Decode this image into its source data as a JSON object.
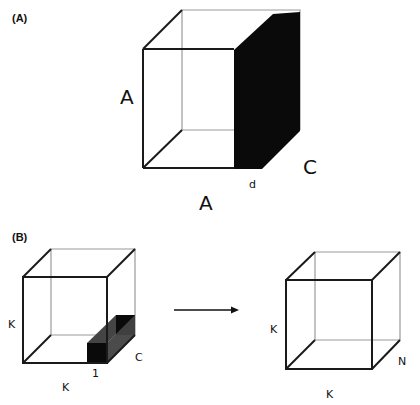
{
  "panel_a": {
    "label": "(A)",
    "dim_height": "A",
    "dim_width": "A",
    "dim_depth": "C",
    "dim_slice": "d"
  },
  "panel_b": {
    "label": "(B)",
    "left_cube": {
      "dim_height": "K",
      "dim_width": "K",
      "dim_depth": "C",
      "dim_block": "1"
    },
    "right_cube": {
      "dim_height": "K",
      "dim_width": "K",
      "dim_depth": "N"
    }
  },
  "colors": {
    "front_edge": "#1a1a1a",
    "back_edge": "#9a9a9a",
    "fill_black": "#0a0a0a",
    "fill_gray": "#444444"
  }
}
